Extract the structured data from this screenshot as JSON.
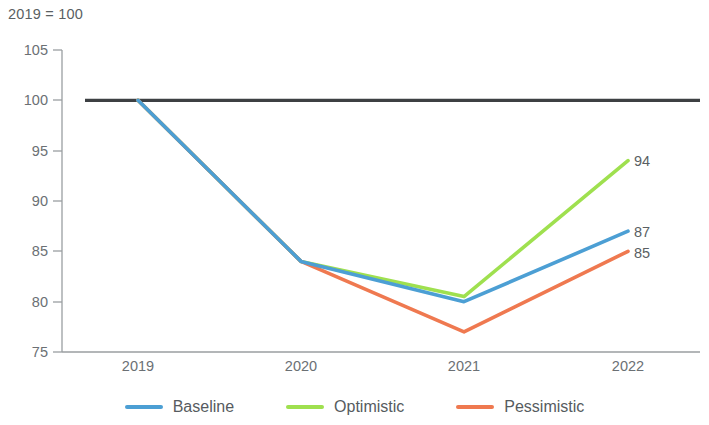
{
  "chart_data": {
    "type": "line",
    "title": "",
    "subtitle": "",
    "note": "2019 = 100",
    "xlabel": "",
    "ylabel": "",
    "categories": [
      "2019",
      "2020",
      "2021",
      "2022"
    ],
    "x": [
      2019,
      2020,
      2021,
      2022
    ],
    "ylim": [
      75,
      105
    ],
    "yticks": [
      75,
      80,
      85,
      90,
      95,
      100,
      105
    ],
    "ytick_labels": [
      "75",
      "80",
      "85",
      "90",
      "95",
      "100",
      "105"
    ],
    "grid": false,
    "legend_position": "bottom",
    "reference_line": {
      "name": "2019 = 100 reference",
      "value": 100,
      "color": "#3d4043"
    },
    "series": [
      {
        "name": "Baseline",
        "color": "#4c9fd4",
        "values": [
          100,
          84,
          80,
          87
        ],
        "end_label": "87"
      },
      {
        "name": "Optimistic",
        "color": "#9fe04f",
        "values": [
          100,
          84,
          80.5,
          94
        ],
        "end_label": "94"
      },
      {
        "name": "Pessimistic",
        "color": "#ef7950",
        "values": [
          100,
          84,
          77,
          85
        ],
        "end_label": "85"
      }
    ],
    "end_labels": [
      "94",
      "87",
      "85"
    ]
  },
  "axis": {
    "note": "2019 = 100",
    "ytick_labels": [
      "105",
      "100",
      "95",
      "90",
      "85",
      "80",
      "75"
    ],
    "xtick_labels": [
      "2019",
      "2020",
      "2021",
      "2022"
    ]
  },
  "legend": {
    "items": [
      {
        "label": "Baseline",
        "color": "#4c9fd4"
      },
      {
        "label": "Optimistic",
        "color": "#9fe04f"
      },
      {
        "label": "Pessimistic",
        "color": "#ef7950"
      }
    ]
  },
  "labels": {
    "optimistic_end": "94",
    "baseline_end": "87",
    "pessimistic_end": "85"
  }
}
